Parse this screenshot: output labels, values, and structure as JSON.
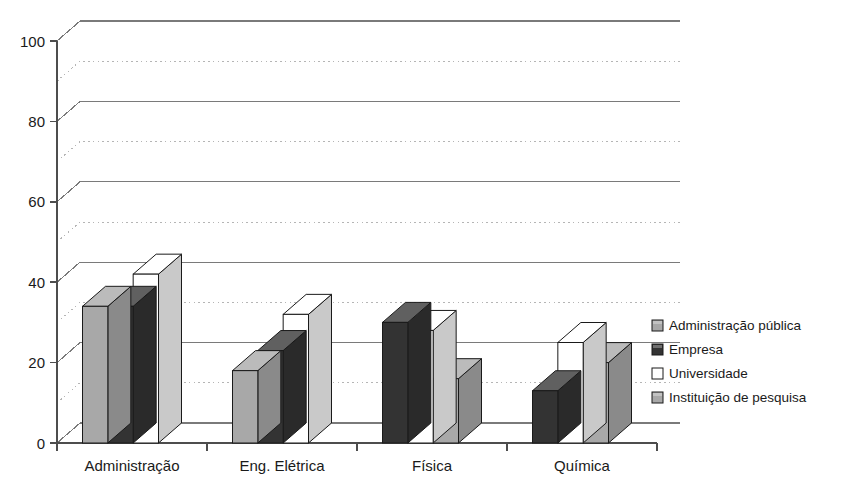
{
  "chart_data": {
    "type": "bar",
    "title": "",
    "subtitle": "",
    "xlabel": "",
    "ylabel": "",
    "categories": [
      "Administração",
      "Eng. Elétrica",
      "Física",
      "Química"
    ],
    "series": [
      {
        "name": "Administração pública",
        "color": "#a8a8a8",
        "values": [
          34,
          18,
          null,
          null
        ]
      },
      {
        "name": "Empresa",
        "color": "#333333",
        "values": [
          34,
          23,
          30,
          13
        ]
      },
      {
        "name": "Universidade",
        "color": "#ffffff",
        "values": [
          42,
          32,
          28,
          25
        ]
      },
      {
        "name": "Instituição de pesquisa",
        "color": "#a8a8a8",
        "values": [
          null,
          null,
          16,
          20
        ]
      }
    ],
    "ylim": [
      0,
      100
    ],
    "yticks": [
      0,
      20,
      40,
      60,
      80,
      100
    ],
    "ytick_labels": [
      "0",
      "20",
      "40",
      "60",
      "80",
      "100"
    ],
    "minor_gridlines": [
      10,
      30,
      50,
      70,
      90
    ],
    "grid": true,
    "grid_major_style": "solid",
    "grid_minor_style": "dotted",
    "legend_position": "right",
    "style": "3d-columns"
  },
  "legend": {
    "items": [
      {
        "label": "Administração pública",
        "swatch": "light-grey",
        "color": "#a8a8a8"
      },
      {
        "label": "Empresa",
        "swatch": "dark-grey",
        "color": "#333333"
      },
      {
        "label": "Universidade",
        "swatch": "white",
        "color": "#ffffff"
      },
      {
        "label": "Instituição de pesquisa",
        "swatch": "light-grey",
        "color": "#a8a8a8"
      }
    ]
  },
  "axis": {
    "y_tick_labels": [
      "100",
      "80",
      "60",
      "40",
      "20",
      "0"
    ],
    "x_tick_labels": [
      "Administração",
      "Eng. Elétrica",
      "Física",
      "Química"
    ]
  },
  "colors": {
    "background": "#ffffff",
    "axis_line": "#4d4d4d",
    "grid_major": "#7a7a7a",
    "grid_minor": "#b5b5b5",
    "bar_light": "#a8a8a8",
    "bar_dark": "#333333",
    "bar_white": "#ffffff",
    "bar_outline": "#1a1a1a",
    "text": "#1a1a1a"
  }
}
